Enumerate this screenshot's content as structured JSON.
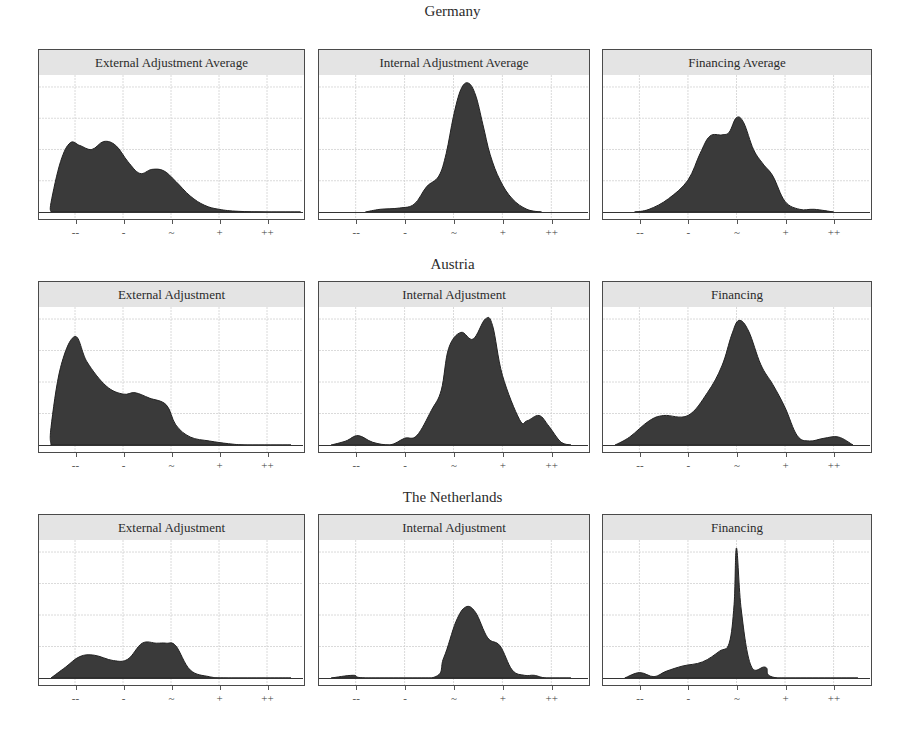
{
  "figure": {
    "rows": [
      {
        "title": "Germany"
      },
      {
        "title": "Austria"
      },
      {
        "title": "The Netherlands"
      }
    ]
  },
  "axis": {
    "x_ticks": [
      "--",
      "-",
      "~",
      "+",
      "++"
    ],
    "x_tick_values": [
      -2,
      -1,
      0,
      1,
      2
    ],
    "x_range": [
      -2.75,
      2.75
    ]
  },
  "style": {
    "fill": "#3a3a3a",
    "strip_bg": "#e4e4e4",
    "grid": "#d0d0d0",
    "border": "#4a4a4a"
  },
  "chart_data": [
    {
      "type": "area",
      "row": "Germany",
      "title": "External Adjustment Average",
      "xlabel": "",
      "ylabel": "",
      "x_ticks": [
        "--",
        "-",
        "~",
        "+",
        "++"
      ],
      "grid": true,
      "points": [
        [
          -2.5,
          0.0
        ],
        [
          -2.5,
          0.07
        ],
        [
          -2.3,
          0.38
        ],
        [
          -2.1,
          0.52
        ],
        [
          -1.9,
          0.5
        ],
        [
          -1.65,
          0.47
        ],
        [
          -1.4,
          0.53
        ],
        [
          -1.15,
          0.5
        ],
        [
          -0.9,
          0.38
        ],
        [
          -0.65,
          0.29
        ],
        [
          -0.4,
          0.32
        ],
        [
          -0.15,
          0.31
        ],
        [
          0.1,
          0.23
        ],
        [
          0.4,
          0.12
        ],
        [
          0.7,
          0.05
        ],
        [
          1.0,
          0.02
        ],
        [
          1.4,
          0.005
        ],
        [
          2.0,
          0.0
        ],
        [
          2.7,
          0.0
        ]
      ]
    },
    {
      "type": "area",
      "row": "Germany",
      "title": "Internal Adjustment Average",
      "x_ticks": [
        "--",
        "-",
        "~",
        "+",
        "++"
      ],
      "grid": true,
      "points": [
        [
          -1.8,
          0.0
        ],
        [
          -1.5,
          0.02
        ],
        [
          -1.1,
          0.03
        ],
        [
          -0.8,
          0.06
        ],
        [
          -0.55,
          0.19
        ],
        [
          -0.3,
          0.27
        ],
        [
          -0.15,
          0.44
        ],
        [
          0.0,
          0.72
        ],
        [
          0.15,
          0.92
        ],
        [
          0.3,
          0.97
        ],
        [
          0.45,
          0.88
        ],
        [
          0.6,
          0.66
        ],
        [
          0.75,
          0.43
        ],
        [
          0.95,
          0.24
        ],
        [
          1.2,
          0.1
        ],
        [
          1.5,
          0.02
        ],
        [
          1.8,
          0.0
        ]
      ]
    },
    {
      "type": "area",
      "row": "Germany",
      "title": "Financing Average",
      "x_ticks": [
        "--",
        "-",
        "~",
        "+",
        "++"
      ],
      "grid": true,
      "points": [
        [
          -2.1,
          0.0
        ],
        [
          -1.8,
          0.02
        ],
        [
          -1.4,
          0.1
        ],
        [
          -1.0,
          0.24
        ],
        [
          -0.75,
          0.44
        ],
        [
          -0.55,
          0.57
        ],
        [
          -0.3,
          0.58
        ],
        [
          -0.15,
          0.6
        ],
        [
          0.0,
          0.71
        ],
        [
          0.15,
          0.67
        ],
        [
          0.35,
          0.47
        ],
        [
          0.55,
          0.36
        ],
        [
          0.75,
          0.27
        ],
        [
          1.0,
          0.08
        ],
        [
          1.3,
          0.02
        ],
        [
          1.6,
          0.02
        ],
        [
          2.0,
          0.0
        ]
      ]
    },
    {
      "type": "area",
      "row": "Austria",
      "title": "External Adjustment",
      "x_ticks": [
        "--",
        "-",
        "~",
        "+",
        "++"
      ],
      "grid": true,
      "points": [
        [
          -2.5,
          0.0
        ],
        [
          -2.5,
          0.13
        ],
        [
          -2.3,
          0.58
        ],
        [
          -2.0,
          0.81
        ],
        [
          -1.75,
          0.62
        ],
        [
          -1.35,
          0.44
        ],
        [
          -1.0,
          0.38
        ],
        [
          -0.75,
          0.39
        ],
        [
          -0.45,
          0.35
        ],
        [
          -0.1,
          0.3
        ],
        [
          0.1,
          0.15
        ],
        [
          0.4,
          0.06
        ],
        [
          0.8,
          0.03
        ],
        [
          1.2,
          0.01
        ],
        [
          1.6,
          0.0
        ],
        [
          2.5,
          0.0
        ]
      ]
    },
    {
      "type": "area",
      "row": "Austria",
      "title": "Internal Adjustment",
      "x_ticks": [
        "--",
        "-",
        "~",
        "+",
        "++"
      ],
      "grid": true,
      "points": [
        [
          -2.5,
          0.0
        ],
        [
          -2.2,
          0.03
        ],
        [
          -1.95,
          0.07
        ],
        [
          -1.65,
          0.02
        ],
        [
          -1.3,
          0.0
        ],
        [
          -1.0,
          0.05
        ],
        [
          -0.75,
          0.07
        ],
        [
          -0.45,
          0.26
        ],
        [
          -0.25,
          0.41
        ],
        [
          -0.1,
          0.72
        ],
        [
          0.15,
          0.84
        ],
        [
          0.4,
          0.79
        ],
        [
          0.65,
          0.94
        ],
        [
          0.8,
          0.89
        ],
        [
          1.0,
          0.52
        ],
        [
          1.35,
          0.19
        ],
        [
          1.5,
          0.18
        ],
        [
          1.75,
          0.22
        ],
        [
          1.95,
          0.14
        ],
        [
          2.2,
          0.02
        ],
        [
          2.4,
          0.0
        ]
      ]
    },
    {
      "type": "area",
      "row": "Austria",
      "title": "Financing",
      "x_ticks": [
        "--",
        "-",
        "~",
        "+",
        "++"
      ],
      "grid": true,
      "points": [
        [
          -2.5,
          0.0
        ],
        [
          -2.2,
          0.06
        ],
        [
          -1.8,
          0.18
        ],
        [
          -1.5,
          0.22
        ],
        [
          -1.0,
          0.22
        ],
        [
          -0.6,
          0.39
        ],
        [
          -0.3,
          0.59
        ],
        [
          -0.1,
          0.82
        ],
        [
          0.05,
          0.93
        ],
        [
          0.25,
          0.85
        ],
        [
          0.5,
          0.6
        ],
        [
          0.75,
          0.45
        ],
        [
          1.0,
          0.28
        ],
        [
          1.25,
          0.07
        ],
        [
          1.5,
          0.03
        ],
        [
          1.8,
          0.05
        ],
        [
          2.1,
          0.06
        ],
        [
          2.4,
          0.0
        ]
      ]
    },
    {
      "type": "area",
      "row": "The Netherlands",
      "title": "External Adjustment",
      "x_ticks": [
        "--",
        "-",
        "~",
        "+",
        "++"
      ],
      "grid": true,
      "points": [
        [
          -2.5,
          0.0
        ],
        [
          -2.2,
          0.08
        ],
        [
          -1.9,
          0.16
        ],
        [
          -1.6,
          0.17
        ],
        [
          -1.2,
          0.13
        ],
        [
          -0.9,
          0.14
        ],
        [
          -0.6,
          0.26
        ],
        [
          -0.3,
          0.26
        ],
        [
          -0.1,
          0.26
        ],
        [
          0.1,
          0.24
        ],
        [
          0.4,
          0.06
        ],
        [
          0.8,
          0.01
        ],
        [
          1.2,
          0.0
        ],
        [
          2.5,
          0.0
        ]
      ]
    },
    {
      "type": "area",
      "row": "The Netherlands",
      "title": "Internal Adjustment",
      "x_ticks": [
        "--",
        "-",
        "~",
        "+",
        "++"
      ],
      "grid": true,
      "points": [
        [
          -2.5,
          0.0
        ],
        [
          -2.05,
          0.02
        ],
        [
          -1.8,
          0.0
        ],
        [
          -0.45,
          0.0
        ],
        [
          -0.2,
          0.15
        ],
        [
          0.05,
          0.42
        ],
        [
          0.25,
          0.53
        ],
        [
          0.45,
          0.49
        ],
        [
          0.7,
          0.3
        ],
        [
          0.95,
          0.24
        ],
        [
          1.2,
          0.06
        ],
        [
          1.45,
          0.02
        ],
        [
          1.65,
          0.02
        ],
        [
          1.9,
          0.0
        ],
        [
          2.4,
          0.0
        ]
      ]
    },
    {
      "type": "area",
      "row": "The Netherlands",
      "title": "Financing",
      "x_ticks": [
        "--",
        "-",
        "~",
        "+",
        "++"
      ],
      "grid": true,
      "points": [
        [
          -2.3,
          0.0
        ],
        [
          -2.0,
          0.04
        ],
        [
          -1.7,
          0.01
        ],
        [
          -1.45,
          0.05
        ],
        [
          -1.1,
          0.09
        ],
        [
          -0.7,
          0.12
        ],
        [
          -0.35,
          0.2
        ],
        [
          -0.15,
          0.26
        ],
        [
          -0.05,
          0.55
        ],
        [
          0.0,
          0.97
        ],
        [
          0.1,
          0.5
        ],
        [
          0.3,
          0.09
        ],
        [
          0.6,
          0.08
        ],
        [
          0.85,
          0.0
        ],
        [
          2.5,
          0.0
        ]
      ]
    }
  ]
}
